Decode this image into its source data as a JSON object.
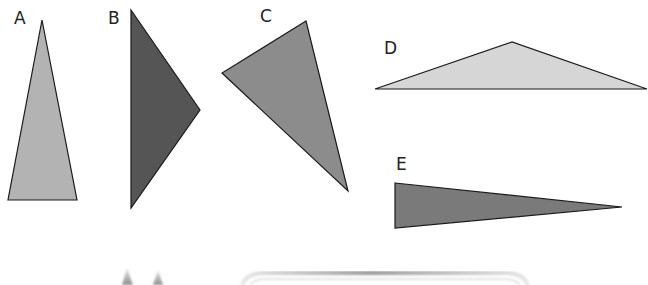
{
  "diagram": {
    "title": "",
    "shapes": [
      {
        "id": "A",
        "label": "A",
        "type": "triangle",
        "fill": "#b3b3b3",
        "points": "42,20 8,200 77,200",
        "label_pos": {
          "x": 14,
          "y": 24
        }
      },
      {
        "id": "B",
        "label": "B",
        "type": "triangle",
        "fill": "#555555",
        "points": "131,10 200,110 131,208",
        "label_pos": {
          "x": 108,
          "y": 24
        }
      },
      {
        "id": "C",
        "label": "C",
        "type": "triangle",
        "fill": "#8c8c8c",
        "points": "306,21 222,73 348,191",
        "label_pos": {
          "x": 260,
          "y": 22
        }
      },
      {
        "id": "D",
        "label": "D",
        "type": "triangle",
        "fill": "#d6d6d6",
        "points": "375,89 512,42 647,89",
        "label_pos": {
          "x": 384,
          "y": 54
        }
      },
      {
        "id": "E",
        "label": "E",
        "type": "triangle",
        "fill": "#7a7a7a",
        "points": "395,183 622,207 395,228",
        "label_pos": {
          "x": 396,
          "y": 170
        }
      }
    ],
    "bottom_fragments": {
      "spikes_fill": "#9a9a9a",
      "frame_stroke": "#cfcfcf"
    }
  }
}
